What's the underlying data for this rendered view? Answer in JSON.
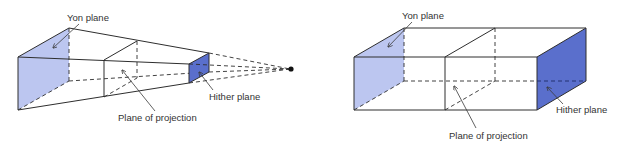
{
  "colors": {
    "yon_fill": "#bcc6f0",
    "hither_fill": "#5a6fcc",
    "line": "#2e2e2e",
    "background": "#ffffff"
  },
  "perspective_view": {
    "labels": {
      "yon": "Yon plane",
      "projection": "Plane of projection",
      "hither": "Hither plane"
    },
    "center_of_projection": "point"
  },
  "parallel_view": {
    "labels": {
      "yon": "Yon plane",
      "projection": "Plane of projection",
      "hither": "Hither plane"
    }
  }
}
